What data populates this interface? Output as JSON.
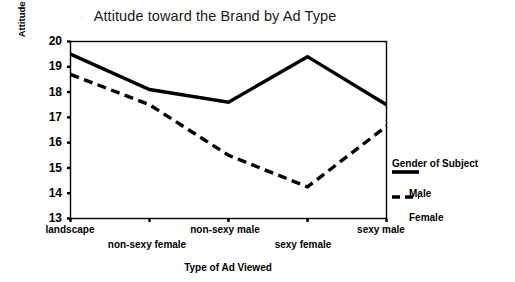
{
  "chart_data": {
    "type": "line",
    "title": "Attitude toward the Brand by Ad Type",
    "xlabel": "Type of Ad Viewed",
    "ylabel": "Attitude toward the Brand",
    "categories": [
      "landscape",
      "non-sexy female",
      "non-sexy male",
      "sexy female",
      "sexy male"
    ],
    "series": [
      {
        "name": "Male",
        "style": "solid",
        "color": "#000000",
        "values": [
          19.5,
          18.1,
          17.6,
          19.4,
          17.5
        ]
      },
      {
        "name": "Female",
        "style": "dashed",
        "color": "#000000",
        "values": [
          18.7,
          17.5,
          15.5,
          14.25,
          16.65
        ]
      }
    ],
    "ylim": [
      13,
      20
    ],
    "yticks": [
      13,
      14,
      15,
      16,
      17,
      18,
      19,
      20
    ],
    "ytick_labels": [
      "13",
      "14",
      "15",
      "16",
      "17",
      "18",
      "19",
      "20"
    ],
    "grid": false,
    "legend": {
      "title": "Gender of Subject",
      "position": "right",
      "entries": [
        {
          "label": "Male",
          "style": "solid"
        },
        {
          "label": "Female",
          "style": "dashed"
        }
      ]
    }
  }
}
